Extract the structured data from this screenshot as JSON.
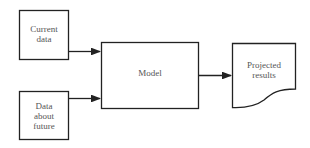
{
  "diagram": {
    "nodes": {
      "current_data": {
        "label_lines": [
          "Current",
          "data"
        ]
      },
      "data_about_future": {
        "label_lines": [
          "Data",
          "about",
          "future"
        ]
      },
      "model": {
        "label": "Model"
      },
      "projected_results": {
        "label_lines": [
          "Projected",
          "results"
        ],
        "shape": "document"
      }
    },
    "edges": [
      {
        "from": "current_data",
        "to": "model"
      },
      {
        "from": "data_about_future",
        "to": "model"
      },
      {
        "from": "model",
        "to": "projected_results"
      }
    ],
    "colors": {
      "stroke": "#222222",
      "text": "#555555",
      "background": "#ffffff"
    }
  }
}
